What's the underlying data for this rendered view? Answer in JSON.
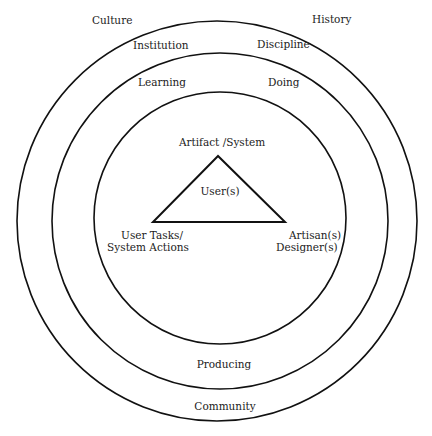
{
  "diagram": {
    "outer_ring": {
      "labels": [
        "Culture",
        "History",
        "Community"
      ]
    },
    "middle_ring": {
      "labels": [
        "Institution",
        "Discipline",
        "Producing"
      ]
    },
    "inner_ring": {
      "labels": [
        "Learning",
        "Doing"
      ]
    },
    "triangle": {
      "top": "Artifact /System",
      "center": "User(s)",
      "left_line1": "User Tasks/",
      "left_line2": "System Actions",
      "right_line1": "Artisan(s)",
      "right_line2": "Designer(s)"
    },
    "colors": {
      "stroke": "#111111",
      "background": "#ffffff",
      "text": "#222222"
    }
  }
}
